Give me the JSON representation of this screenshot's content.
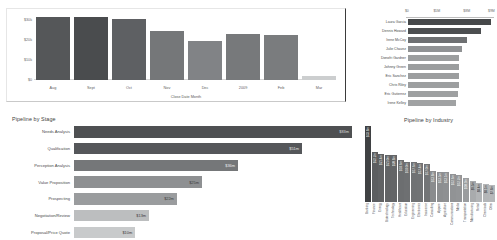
{
  "chart_data": [
    {
      "id": "deal-size-by-close-month",
      "type": "bar",
      "title": "",
      "xlabel": "Close Date Month",
      "ylabel": "Deal Size",
      "categories": [
        "Aug",
        "Sept",
        "Oct",
        "Nov",
        "Dec",
        "2009",
        "Feb",
        "Mar"
      ],
      "values": [
        31500,
        31500,
        30500,
        24500,
        19500,
        23000,
        22500,
        2000
      ],
      "yticks": [
        "$30k",
        "$20k",
        "$10k",
        "$0"
      ],
      "ytick_values": [
        30000,
        20000,
        10000,
        0
      ],
      "ylim": [
        0,
        33000
      ],
      "grid": false,
      "legend": "none",
      "bar_colors": [
        "#555759",
        "#4a4c4e",
        "#5e6063",
        "#757779",
        "#818386",
        "#77797b",
        "#7a7c7e",
        "#cccecf"
      ]
    },
    {
      "id": "top-opportunity-owners",
      "type": "bar",
      "orientation": "horizontal",
      "title": "",
      "xlabel": "",
      "ylabel": "",
      "categories": [
        "Laura Garcia",
        "Dennis Howard",
        "Irene McCoy",
        "Julie Chavez",
        "Donofri Gardner",
        "Johnny Green",
        "Eric Sanchez",
        "Chris Riley",
        "Eric Gutierrez",
        "Irene Kelley"
      ],
      "values": [
        9.9,
        8.6,
        7.0,
        6.4,
        6.1,
        6.1,
        6.1,
        6.0,
        5.9,
        5.7
      ],
      "xticks": [
        "$0",
        "$5M",
        "$8M",
        "$9M"
      ],
      "xtick_pct": [
        1,
        35,
        69,
        97
      ],
      "xlim": [
        0,
        10.2
      ],
      "grid": false,
      "bar_colors": [
        "#46484a",
        "#4c4e50",
        "#6e7072",
        "#909294",
        "#9c9e9f",
        "#9b9d9e",
        "#9c9e9f",
        "#9d9fa0",
        "#9ea0a1",
        "#a0a2a3"
      ]
    },
    {
      "id": "pipeline-by-stage",
      "type": "bar",
      "orientation": "horizontal",
      "title": "Pipeline by Stage",
      "xlabel": "",
      "ylabel": "",
      "categories": [
        "Needs Analysis",
        "Qualification",
        "Perception Analysis",
        "Value Proposition",
        "Prospecting",
        "Negotiation/Review",
        "Proposal/Price Quote"
      ],
      "values": [
        83,
        52,
        36,
        25,
        22,
        13,
        10
      ],
      "value_labels": [
        "$83m",
        "$51m",
        "$36m",
        "$25m",
        "$22m",
        "$13m",
        "$10m"
      ],
      "bar_pct": [
        100,
        82,
        59,
        46,
        37,
        27,
        22
      ],
      "xlim": [
        0,
        85
      ],
      "grid": false,
      "bar_colors": [
        "#4e5052",
        "#55575a",
        "#757779",
        "#8e9092",
        "#9a9c9e",
        "#bcbebf",
        "#c8cacb"
      ],
      "label_colors": [
        "#d8dadb",
        "#e3e5e6",
        "#eceeef",
        "#3c3c3c",
        "#3c3c3c",
        "#3c3c3c",
        "#3c3c3c"
      ]
    },
    {
      "id": "pipeline-by-industry",
      "type": "bar",
      "title": "Pipeline by Industry",
      "xlabel": "",
      "ylabel": "",
      "categories": [
        "Banking",
        "Finance",
        "Energy",
        "Biotechnology",
        "Technology",
        "Healthcare",
        "Education",
        "Engineering",
        "Electronics",
        "Insurance",
        "Consulting",
        "Apparel",
        "Agriculture",
        "Communications",
        "Media",
        "Transportation",
        "Manufacturing",
        "Retail",
        "Chemicals",
        "Other"
      ],
      "values": [
        33.8,
        22.2,
        21.4,
        21.0,
        20.8,
        18.6,
        18.0,
        17.6,
        17.4,
        17.0,
        13.8,
        13.5,
        13.1,
        12.6,
        12.2,
        10.9,
        9.5,
        8.4,
        8.1,
        7.8
      ],
      "value_labels": [
        "$33.8m",
        "$22.2m",
        "$21.4m",
        "$21.0m",
        "$20.8m",
        "$18.6m",
        "$18.0m",
        "$17.6m",
        "$17.4m",
        "$17.0m",
        "$13.8m",
        "$13.5m",
        "$13.1m",
        "$12.6m",
        "$12.2m",
        "$10.9m",
        "$9.5m",
        "$8.4m",
        "$8.1m",
        "$7.8m"
      ],
      "bar_pct": [
        100,
        66,
        63,
        62,
        62,
        55,
        53,
        52,
        51,
        50,
        41,
        40,
        39,
        37,
        36,
        32,
        28,
        25,
        24,
        23
      ],
      "ylim": [
        0,
        34
      ],
      "grid": false,
      "bar_colors": [
        "#3f4143",
        "#5c5e60",
        "#606264",
        "#626466",
        "#636567",
        "#6c6e70",
        "#6e7072",
        "#707274",
        "#717375",
        "#737577",
        "#8a8c8e",
        "#8c8e90",
        "#8e9092",
        "#919395",
        "#939597",
        "#9b9d9f",
        "#a9abad",
        "#b2b4b6",
        "#b4b6b8",
        "#b6b8ba"
      ],
      "label_colors": [
        "#e8eaeb",
        "#e8eaeb",
        "#e8eaeb",
        "#e8eaeb",
        "#e8eaeb",
        "#e8eaeb",
        "#e8eaeb",
        "#e8eaeb",
        "#e8eaeb",
        "#e8eaeb",
        "#f0f2f3",
        "#f0f2f3",
        "#f0f2f3",
        "#f0f2f3",
        "#f0f2f3",
        "#f5f7f8",
        "#3c3c3c",
        "#3c3c3c",
        "#3c3c3c",
        "#3c3c3c"
      ]
    }
  ],
  "deal_size": {
    "ylabel": "Deal Size",
    "xlabel": "Close Date Month"
  },
  "stage": {
    "title": "Pipeline by Stage"
  },
  "industry": {
    "title": "Pipeline by Industry"
  }
}
